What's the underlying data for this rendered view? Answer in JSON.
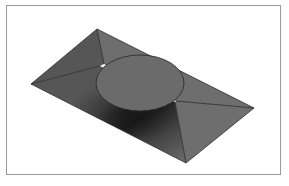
{
  "figure": {
    "title": "",
    "caption": ""
  },
  "colors": {
    "background": "#ffffff",
    "frame_border": "#9a9a9a",
    "plate_light": "#6e6e6e",
    "plate_mid": "#565656",
    "plate_dark": "#232323",
    "boss_top": "#6b6b6b",
    "edge_line": "#2e2e2e"
  },
  "parts": [
    {
      "name": "plate",
      "label": "Plate"
    },
    {
      "name": "boss",
      "label": "Circular boss"
    }
  ]
}
